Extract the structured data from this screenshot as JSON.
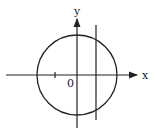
{
  "diagram": {
    "type": "coordinate-plane",
    "x_axis_label": "x",
    "y_axis_label": "y",
    "origin_label": "0",
    "stroke_color": "#222222",
    "background": "#ffffff",
    "shapes": [
      {
        "kind": "circle",
        "description": "circle centered at origin"
      },
      {
        "kind": "vertical-line",
        "description": "vertical line x = a, right of y-axis, intersecting circle"
      },
      {
        "kind": "tick",
        "description": "tick mark on negative x-axis"
      }
    ]
  }
}
